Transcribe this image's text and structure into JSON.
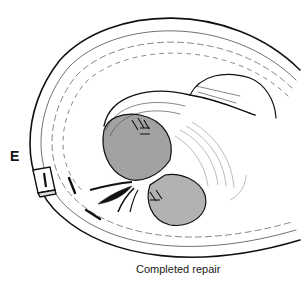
{
  "figure": {
    "panel_label": "E",
    "caption": "Completed repair",
    "colors": {
      "ink": "#111111",
      "background": "#ffffff"
    }
  }
}
